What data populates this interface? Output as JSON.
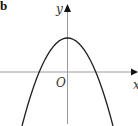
{
  "figure": {
    "part_label": "b",
    "y_axis_label": "y",
    "x_axis_label": "x",
    "origin_label": "O",
    "curve": "downward-opening parabola",
    "vertex": "on positive y-axis",
    "x_intercepts": "two, symmetric about y-axis"
  },
  "colors": {
    "axis": "#aaaaaa",
    "curve": "#222222",
    "arrow": "#111111",
    "background": "#ffffff"
  }
}
